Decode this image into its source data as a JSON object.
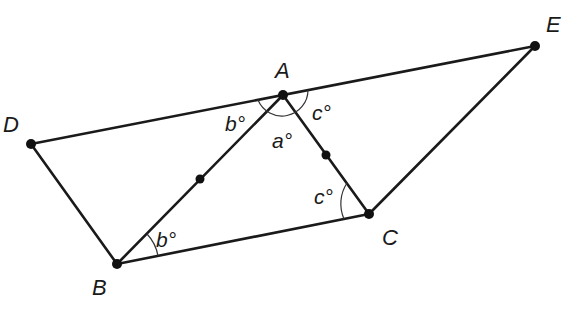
{
  "diagram": {
    "type": "geometry",
    "points": [
      {
        "id": "A",
        "label": "A",
        "x": 283,
        "y": 95
      },
      {
        "id": "B",
        "label": "B",
        "x": 117,
        "y": 264
      },
      {
        "id": "C",
        "label": "C",
        "x": 369,
        "y": 214
      },
      {
        "id": "D",
        "label": "D",
        "x": 31,
        "y": 144
      },
      {
        "id": "E",
        "label": "E",
        "x": 535,
        "y": 46
      }
    ],
    "midpoints": [
      {
        "on": "AB",
        "x": 200,
        "y": 179
      },
      {
        "on": "AC",
        "x": 326,
        "y": 155
      }
    ],
    "segments": [
      "DE",
      "DB",
      "BC",
      "CE",
      "AB",
      "AC"
    ],
    "angle_labels": {
      "a": "a°",
      "b_top": "b°",
      "c_top": "c°",
      "b_bottom": "b°",
      "c_bottom": "c°"
    }
  }
}
